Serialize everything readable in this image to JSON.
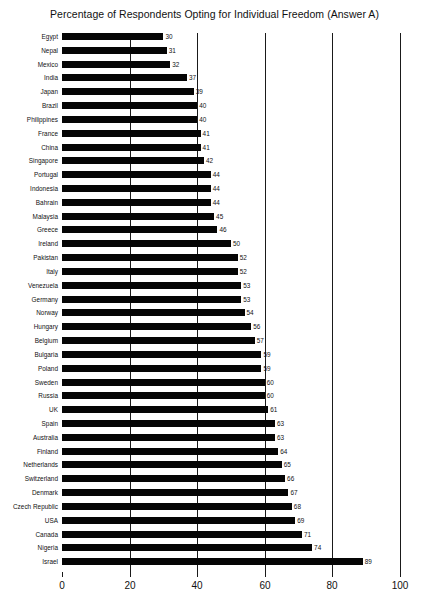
{
  "chart_data": {
    "type": "bar",
    "orientation": "horizontal",
    "title": "Percentage of Respondents Opting for Individual Freedom (Answer A)",
    "xlabel": "",
    "ylabel": "",
    "xlim": [
      0,
      100
    ],
    "grid": true,
    "legend": "none",
    "xticks": [
      "0",
      "20",
      "40",
      "60",
      "80",
      "100"
    ],
    "xtick_values": [
      0,
      20,
      40,
      60,
      80,
      100
    ],
    "categories": [
      "Egypt",
      "Nepal",
      "Mexico",
      "India",
      "Japan",
      "Brazil",
      "Philippines",
      "France",
      "China",
      "Singapore",
      "Portugal",
      "Indonesia",
      "Bahrain",
      "Malaysia",
      "Greece",
      "Ireland",
      "Pakistan",
      "Italy",
      "Venezuela",
      "Germany",
      "Norway",
      "Hungary",
      "Belgium",
      "Bulgaria",
      "Poland",
      "Sweden",
      "Russia",
      "UK",
      "Spain",
      "Australia",
      "Finland",
      "Netherlands",
      "Switzerland",
      "Denmark",
      "Czech Republic",
      "USA",
      "Canada",
      "Nigeria",
      "Israel"
    ],
    "values": [
      30,
      31,
      32,
      37,
      39,
      40,
      40,
      41,
      41,
      42,
      44,
      44,
      44,
      45,
      46,
      50,
      52,
      52,
      53,
      53,
      54,
      56,
      57,
      59,
      59,
      60,
      60,
      61,
      63,
      63,
      64,
      65,
      66,
      67,
      68,
      69,
      71,
      74,
      89
    ],
    "data_labels": [
      "30",
      "31",
      "32",
      "37",
      "39",
      "40",
      "40",
      "41",
      "41",
      "42",
      "44",
      "44",
      "44",
      "45",
      "46",
      "50",
      "52",
      "52",
      "53",
      "53",
      "54",
      "56",
      "57",
      "59",
      "59",
      "60",
      "60",
      "61",
      "63",
      "63",
      "64",
      "65",
      "66",
      "67",
      "68",
      "69",
      "71",
      "74",
      "89"
    ],
    "bar_color": "#050505",
    "grid_color": "#1a1a1a",
    "background_color": "#ffffff"
  }
}
